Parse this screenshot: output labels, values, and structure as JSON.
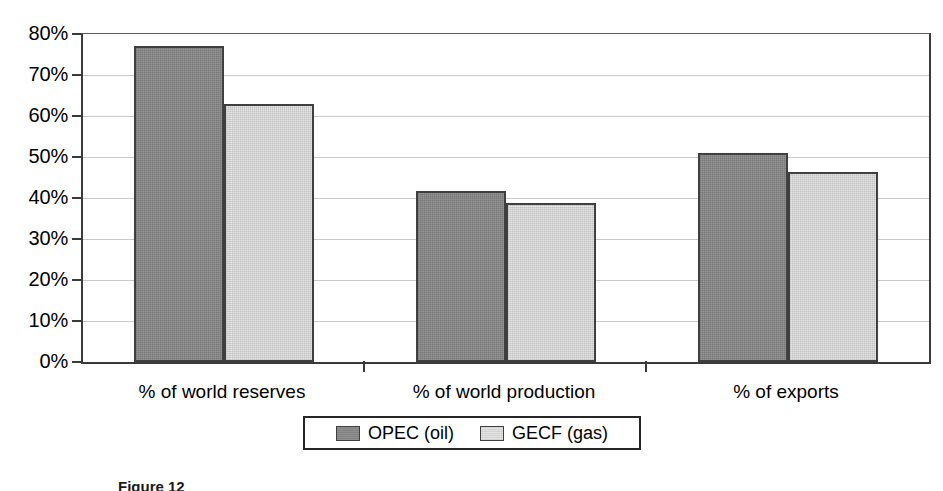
{
  "chart_data": {
    "type": "bar",
    "title": "",
    "subtitle": "",
    "xlabel": "",
    "ylabel": "",
    "categories": [
      "% of world reserves",
      "% of world production",
      "% of exports"
    ],
    "series": [
      {
        "name": "OPEC (oil)",
        "values": [
          77,
          41.7,
          51
        ],
        "color": "#828282"
      },
      {
        "name": "GECF (gas)",
        "values": [
          63,
          38.8,
          46.3
        ],
        "color": "#e2e2e2"
      }
    ],
    "ylim": [
      0,
      80
    ],
    "ytick_values": [
      0,
      10,
      20,
      30,
      40,
      50,
      60,
      70,
      80
    ],
    "ytick_labels": [
      "0%",
      "10%",
      "20%",
      "30%",
      "40%",
      "50%",
      "60%",
      "70%",
      "80%"
    ],
    "ytick_format": "percent",
    "grid": "horizontal",
    "legend_position": "bottom-center",
    "annotations": []
  },
  "legend": {
    "entries": [
      {
        "label": "OPEC (oil)",
        "swatch": "series-opec"
      },
      {
        "label": "GECF (gas)",
        "swatch": "series-gecf"
      }
    ]
  },
  "caption": {
    "text": "Figure 12"
  }
}
